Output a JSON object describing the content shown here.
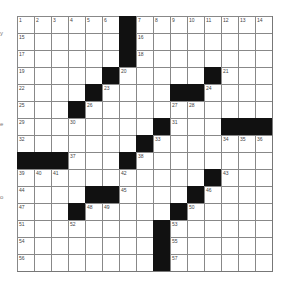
{
  "puzzle": {
    "rows": 15,
    "cols": 15,
    "left_margin_fragments": [
      {
        "text": "y",
        "y": 30
      },
      {
        "text": "e",
        "y": 121
      },
      {
        "text": "o",
        "y": 194
      }
    ],
    "blocks": [
      [
        0,
        6
      ],
      [
        1,
        6
      ],
      [
        2,
        6
      ],
      [
        3,
        5
      ],
      [
        3,
        11
      ],
      [
        4,
        4
      ],
      [
        4,
        9
      ],
      [
        4,
        10
      ],
      [
        5,
        3
      ],
      [
        6,
        8
      ],
      [
        6,
        12
      ],
      [
        6,
        13
      ],
      [
        6,
        14
      ],
      [
        7,
        7
      ],
      [
        8,
        0
      ],
      [
        8,
        1
      ],
      [
        8,
        2
      ],
      [
        8,
        6
      ],
      [
        9,
        11
      ],
      [
        10,
        4
      ],
      [
        10,
        5
      ],
      [
        10,
        10
      ],
      [
        11,
        3
      ],
      [
        11,
        9
      ],
      [
        12,
        8
      ],
      [
        13,
        8
      ],
      [
        14,
        8
      ]
    ],
    "numbers": [
      [
        0,
        0,
        "1"
      ],
      [
        0,
        1,
        "2"
      ],
      [
        0,
        2,
        "3"
      ],
      [
        0,
        3,
        "4"
      ],
      [
        0,
        4,
        "5"
      ],
      [
        0,
        5,
        "6"
      ],
      [
        0,
        7,
        "7"
      ],
      [
        0,
        8,
        "8"
      ],
      [
        0,
        9,
        "9"
      ],
      [
        0,
        10,
        "10"
      ],
      [
        0,
        11,
        "11"
      ],
      [
        0,
        12,
        "12"
      ],
      [
        0,
        13,
        "13"
      ],
      [
        0,
        14,
        "14"
      ],
      [
        1,
        0,
        "15"
      ],
      [
        1,
        7,
        "16"
      ],
      [
        2,
        0,
        "17"
      ],
      [
        2,
        7,
        "18"
      ],
      [
        3,
        0,
        "19"
      ],
      [
        3,
        6,
        "20"
      ],
      [
        3,
        12,
        "21"
      ],
      [
        4,
        0,
        "22"
      ],
      [
        4,
        5,
        "23"
      ],
      [
        4,
        11,
        "24"
      ],
      [
        5,
        0,
        "25"
      ],
      [
        5,
        4,
        "26"
      ],
      [
        5,
        9,
        "27"
      ],
      [
        5,
        10,
        "28"
      ],
      [
        6,
        0,
        "29"
      ],
      [
        6,
        3,
        "30"
      ],
      [
        6,
        9,
        "31"
      ],
      [
        7,
        0,
        "32"
      ],
      [
        7,
        8,
        "33"
      ],
      [
        7,
        12,
        "34"
      ],
      [
        7,
        13,
        "35"
      ],
      [
        7,
        14,
        "36"
      ],
      [
        8,
        3,
        "37"
      ],
      [
        8,
        7,
        "38"
      ],
      [
        9,
        0,
        "39"
      ],
      [
        9,
        1,
        "40"
      ],
      [
        9,
        2,
        "41"
      ],
      [
        9,
        6,
        "42"
      ],
      [
        9,
        12,
        "43"
      ],
      [
        10,
        0,
        "44"
      ],
      [
        10,
        6,
        "45"
      ],
      [
        10,
        11,
        "46"
      ],
      [
        11,
        0,
        "47"
      ],
      [
        11,
        4,
        "48"
      ],
      [
        11,
        5,
        "49"
      ],
      [
        11,
        10,
        "50"
      ],
      [
        12,
        0,
        "51"
      ],
      [
        12,
        3,
        "52"
      ],
      [
        12,
        9,
        "53"
      ],
      [
        13,
        0,
        "54"
      ],
      [
        13,
        9,
        "55"
      ],
      [
        14,
        0,
        "56"
      ],
      [
        14,
        9,
        "57"
      ]
    ]
  }
}
